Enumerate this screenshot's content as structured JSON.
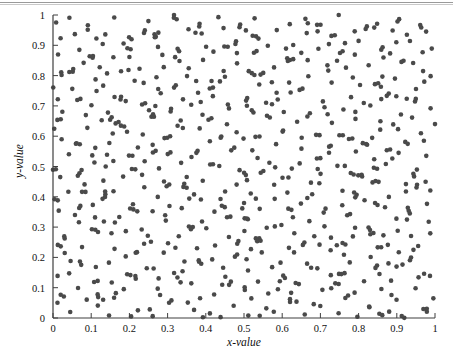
{
  "figure": {
    "background_color": "#ffffff",
    "top_rule_color": "#9a9a9a",
    "axis_color": "#3f3f3f",
    "point_color": "#4a4a4a"
  },
  "axes": {
    "x_label": "x-value",
    "y_label": "y-value",
    "x_ticks": [
      "0",
      "0.1",
      "0.2",
      "0.3",
      "0.4",
      "0.5",
      "0.6",
      "0.7",
      "0.8",
      "0.9",
      "1"
    ],
    "y_ticks": [
      "0",
      "0.1",
      "0.2",
      "0.3",
      "0.4",
      "0.5",
      "0.6",
      "0.7",
      "0.8",
      "0.9",
      "1"
    ]
  },
  "chart_data": {
    "type": "scatter",
    "title": "",
    "xlabel": "x-value",
    "ylabel": "y-value",
    "xlim": [
      0,
      1
    ],
    "ylim": [
      0,
      1
    ],
    "xticks": [
      0,
      0.1,
      0.2,
      0.3,
      0.4,
      0.5,
      0.6,
      0.7,
      0.8,
      0.9,
      1
    ],
    "yticks": [
      0,
      0.1,
      0.2,
      0.3,
      0.4,
      0.5,
      0.6,
      0.7,
      0.8,
      0.9,
      1
    ],
    "grid": false,
    "legend": null,
    "marker": "circle",
    "marker_size_px": 4.6,
    "marker_color": "#4a4a4a",
    "n_points": 580,
    "distribution": "quasi-random low-discrepancy (Halton bases 2 and 3) with small paired jitter",
    "generator": {
      "kind": "halton",
      "base_x": 2,
      "base_y": 3,
      "count": 580,
      "jitter_amplitude": 0.012,
      "pair_fraction": 0.16,
      "pair_offset": 0.009,
      "seed": 20250117
    },
    "series": [
      {
        "name": "samples",
        "color": "#4a4a4a",
        "x": [],
        "y": []
      }
    ]
  }
}
